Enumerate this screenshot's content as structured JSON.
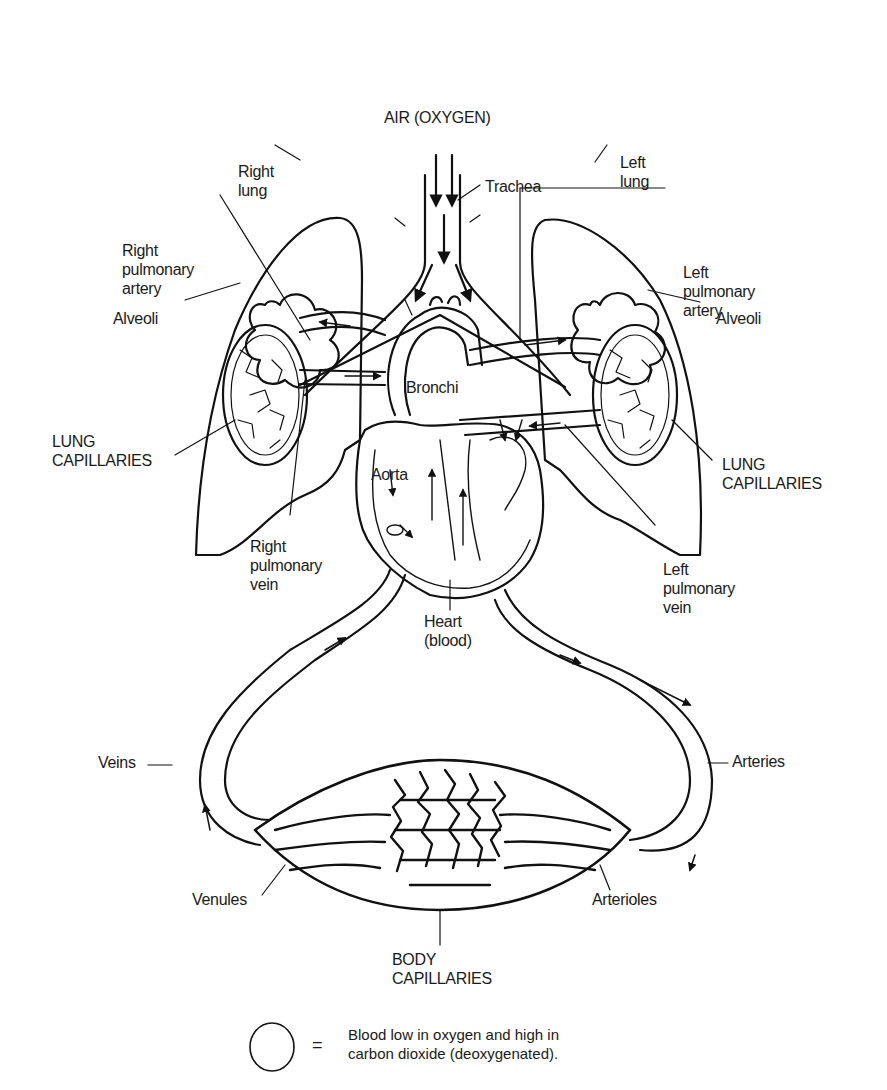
{
  "title_label": "AIR (OXYGEN)",
  "labels": {
    "trachea": "Trachea",
    "right_lung": "Right\nlung",
    "left_lung": "Left\nlung",
    "right_pulmonary_artery": "Right\npulmonary\nartery",
    "left_pulmonary_artery": "Left\npulmonary\nartery",
    "bronchi": "Bronchi",
    "aorta": "Aorta",
    "alveoli_right": "Alveoli",
    "alveoli_left": "Alveoli",
    "lung_capillaries_right": "LUNG\nCAPILLARIES",
    "lung_capillaries_left": "LUNG\nCAPILLARIES",
    "right_pulmonary_vein": "Right\npulmonary\nvein",
    "left_pulmonary_vein": "Left\npulmonary\nvein",
    "heart": "Heart\n(blood)",
    "veins": "Veins",
    "arteries": "Arteries",
    "venules": "Venules",
    "arterioles": "Arterioles",
    "body_capillaries": "BODY\nCAPILLARIES"
  },
  "legend": {
    "symbol": "empty-circle",
    "equals": "=",
    "text_line1": "Blood low in oxygen and high in",
    "text_line2": "carbon dioxide (deoxygenated)."
  },
  "colors": {
    "line": "#111111",
    "background": "#ffffff"
  }
}
